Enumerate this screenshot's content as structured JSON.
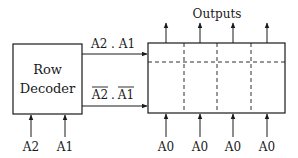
{
  "decoder": {
    "label_line1": "Row",
    "label_line2": "Decoder",
    "inputs": [
      "A2",
      "A1"
    ]
  },
  "signals": {
    "top": "A2 . A1",
    "bottom_a": "A2",
    "bottom_sep": ".",
    "bottom_b": "A1"
  },
  "array": {
    "outputs_label": "Outputs",
    "column_inputs": [
      "A0",
      "A0",
      "A0",
      "A0"
    ]
  },
  "colors": {
    "stroke": "#1a1a1a",
    "background": "#ffffff"
  }
}
